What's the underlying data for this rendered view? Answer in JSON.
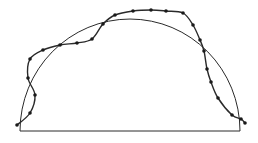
{
  "diagram": {
    "colors": {
      "background": "#ffffff",
      "stroke": "#2a2a2a",
      "point": "#1a1a1a"
    },
    "baseline": {
      "x1": 20,
      "y1": 131,
      "x2": 240,
      "y2": 131
    },
    "semicircle": {
      "cx": 130,
      "cy": 131,
      "rx": 110,
      "ry": 112
    },
    "points": [
      [
        17,
        125
      ],
      [
        30,
        113
      ],
      [
        35,
        95
      ],
      [
        28,
        78
      ],
      [
        30,
        59
      ],
      [
        43,
        50
      ],
      [
        60,
        45
      ],
      [
        77,
        43
      ],
      [
        92,
        39
      ],
      [
        103,
        24
      ],
      [
        115,
        15
      ],
      [
        133,
        11
      ],
      [
        151,
        10
      ],
      [
        166,
        11
      ],
      [
        183,
        13
      ],
      [
        193,
        25
      ],
      [
        200,
        40
      ],
      [
        204,
        51
      ],
      [
        207,
        69
      ],
      [
        211,
        82
      ],
      [
        218,
        98
      ],
      [
        232,
        115
      ],
      [
        241,
        119
      ],
      [
        245,
        123
      ]
    ]
  }
}
